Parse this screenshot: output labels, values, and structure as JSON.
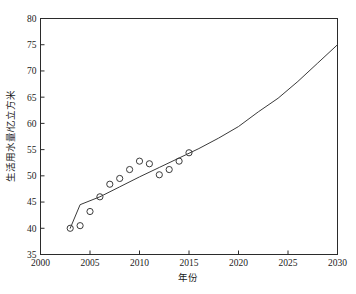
{
  "chart_data": {
    "type": "scatter",
    "title": "",
    "subtitle": "",
    "xlabel": "年份",
    "ylabel": "生活用水量/亿立方米",
    "xlim": [
      2000,
      2030
    ],
    "ylim": [
      35,
      80
    ],
    "xticks": [
      2000,
      2005,
      2010,
      2015,
      2020,
      2025,
      2030
    ],
    "xtick_labels": [
      "2000",
      "2005",
      "2010",
      "2015",
      "2020",
      "2025",
      "2030"
    ],
    "yticks": [
      35,
      40,
      45,
      50,
      55,
      60,
      65,
      70,
      75,
      80
    ],
    "ytick_labels": [
      "35",
      "40",
      "45",
      "50",
      "55",
      "60",
      "65",
      "70",
      "75",
      "80"
    ],
    "grid": false,
    "legend": false,
    "legend_position": "none",
    "series": [
      {
        "name": "观测值",
        "kind": "scatter",
        "marker": "open-circle",
        "color": "#3a3a3a",
        "x": [
          2003,
          2004,
          2005,
          2006,
          2007,
          2008,
          2009,
          2010,
          2011,
          2012,
          2013,
          2014,
          2015
        ],
        "values": [
          40.0,
          40.5,
          43.2,
          46.0,
          48.4,
          49.5,
          51.2,
          52.8,
          52.3,
          50.2,
          51.2,
          52.8,
          54.4
        ]
      },
      {
        "name": "拟合预测曲线",
        "kind": "line",
        "color": "#3a3a3a",
        "x": [
          2003,
          2004,
          2006,
          2008,
          2010,
          2012,
          2014,
          2016,
          2018,
          2020,
          2022,
          2024,
          2026,
          2028,
          2030
        ],
        "values": [
          40.0,
          44.5,
          46.0,
          47.9,
          49.8,
          51.6,
          53.4,
          55.2,
          57.2,
          59.4,
          62.2,
          64.8,
          68.0,
          71.5,
          75.0
        ]
      }
    ]
  },
  "axes": {
    "x_axis_name": "年份",
    "y_axis_name": "生活用水量/亿立方米"
  }
}
